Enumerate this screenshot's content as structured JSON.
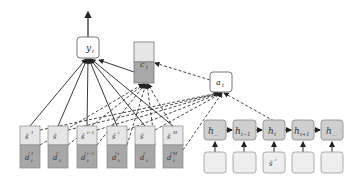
{
  "diagram": {
    "type": "neural-attention-architecture",
    "output_node": {
      "label": "y",
      "sub": "t"
    },
    "context_vector": {
      "label": "c",
      "sub": "t"
    },
    "attention_node": {
      "label": "a",
      "sub": "t"
    },
    "memory_slots": [
      {
        "top": "s̄",
        "top_sup": "1",
        "bottom": "d̄",
        "bottom_sub": "t",
        "bottom_sup": "1"
      },
      {
        "top": "s̄",
        "top_sup": "·",
        "bottom": "d̄",
        "bottom_sub": "t",
        "bottom_sup": "·"
      },
      {
        "top": "s̄",
        "top_sup": "i−1",
        "bottom": "d̄",
        "bottom_sub": "t",
        "bottom_sup": "i−1"
      },
      {
        "top": "s̄",
        "top_sup": "i",
        "bottom": "d̄",
        "bottom_sub": "t",
        "bottom_sup": "i"
      },
      {
        "top": "s̄",
        "top_sup": "·",
        "bottom": "d̄",
        "bottom_sub": "t",
        "bottom_sup": "·"
      },
      {
        "top": "s̄",
        "top_sup": "M",
        "bottom": "d̄",
        "bottom_sub": "t",
        "bottom_sup": "M"
      }
    ],
    "rnn_states": [
      {
        "label": "h",
        "sub": "..."
      },
      {
        "label": "h",
        "sub": "t−1"
      },
      {
        "label": "h",
        "sub": "t"
      },
      {
        "label": "h",
        "sub": "t+1"
      },
      {
        "label": "h",
        "sub": "..."
      }
    ],
    "rnn_inputs": [
      {
        "label": ""
      },
      {
        "label": ""
      },
      {
        "label": "s̄",
        "sup": "i"
      },
      {
        "label": ""
      },
      {
        "label": ""
      }
    ],
    "colors": {
      "light_fill": "#e6e6e6",
      "dark_fill": "#a8a8a8",
      "state_fill": "#cfcfcf",
      "box_stroke": "#777777",
      "line": "#222222"
    }
  }
}
